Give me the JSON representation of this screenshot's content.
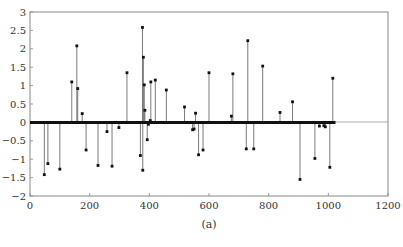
{
  "chart_data": {
    "type": "stem",
    "title": "",
    "caption": "(a)",
    "xlabel": "",
    "ylabel": "",
    "xlim": [
      0,
      1200
    ],
    "ylim": [
      -2,
      3
    ],
    "x_ticks": [
      0,
      200,
      400,
      600,
      800,
      1000,
      1200
    ],
    "x_tick_labels": [
      "0",
      "200",
      "400",
      "600",
      "800",
      "1000",
      "1200"
    ],
    "y_ticks": [
      -2,
      -1.5,
      -1,
      -0.5,
      0,
      0.5,
      1,
      1.5,
      2,
      2.5,
      3
    ],
    "y_tick_labels": [
      "−2",
      "−1.5",
      "−1",
      "−0.5",
      "0",
      "0.5",
      "1",
      "1.5",
      "2",
      "2.5",
      "3"
    ],
    "grid": false,
    "legend": null,
    "baseline": {
      "from": 0,
      "to": 1024,
      "value": 0
    },
    "series": [
      {
        "name": "coefficients",
        "x": [
          48,
          60,
          100,
          140,
          157,
          160,
          175,
          188,
          228,
          258,
          275,
          298,
          325,
          370,
          377,
          378,
          380,
          383,
          385,
          393,
          397,
          403,
          405,
          420,
          457,
          518,
          545,
          550,
          555,
          565,
          580,
          600,
          675,
          680,
          725,
          730,
          750,
          780,
          838,
          880,
          905,
          955,
          970,
          985,
          990,
          1005,
          1015
        ],
        "values": [
          -1.42,
          -1.12,
          -1.27,
          1.1,
          2.08,
          0.92,
          0.24,
          -0.75,
          -1.17,
          -0.25,
          -1.19,
          -0.14,
          1.35,
          -0.9,
          2.58,
          -1.3,
          1.77,
          1.02,
          0.33,
          -0.47,
          -0.05,
          0.05,
          1.1,
          1.15,
          0.88,
          0.42,
          -0.2,
          -0.18,
          0.25,
          -0.88,
          -0.75,
          1.35,
          0.17,
          1.32,
          -0.72,
          2.22,
          -0.72,
          1.53,
          0.27,
          0.56,
          -1.55,
          -0.98,
          -0.1,
          -0.09,
          -0.12,
          -1.22,
          1.2
        ]
      }
    ]
  },
  "colors": {
    "stem": "#6b6b6b",
    "marker": "#111111",
    "baseline": "#111111",
    "axis": "#888888"
  }
}
